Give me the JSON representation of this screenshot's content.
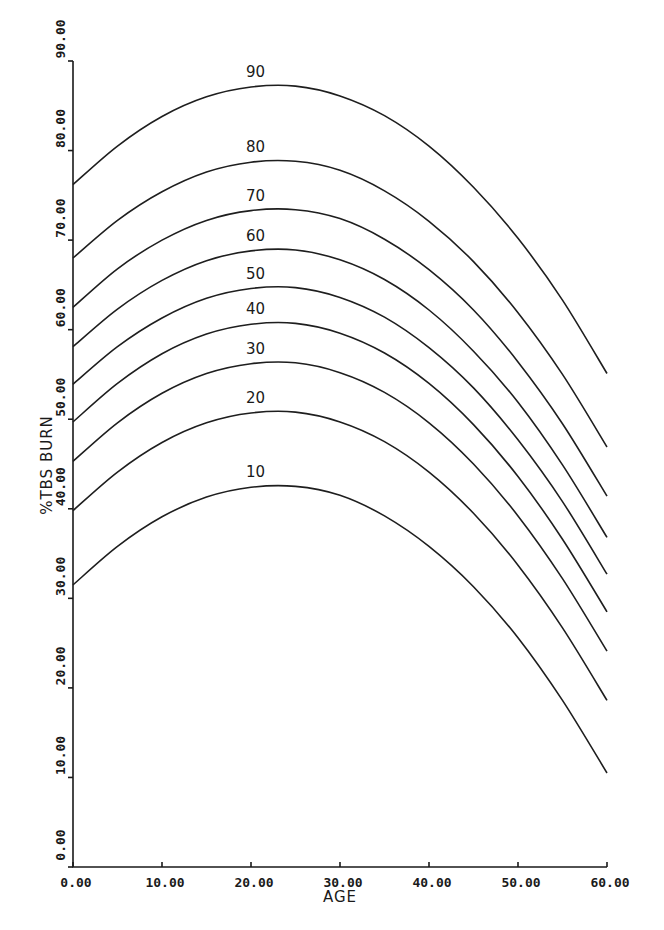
{
  "chart_data": {
    "type": "line",
    "title": "",
    "xlabel": "AGE",
    "ylabel": "%TBS BURN",
    "xlim": [
      0,
      60
    ],
    "ylim": [
      0,
      90
    ],
    "grid": false,
    "legend": "inline labels above each curve peak",
    "x_ticks": [
      "0.00",
      "10.00",
      "20.00",
      "30.00",
      "40.00",
      "50.00",
      "60.00"
    ],
    "y_ticks": [
      "0.00",
      "10.00",
      "20.00",
      "30.00",
      "40.00",
      "50.00",
      "60.00",
      "70.00",
      "80.00",
      "90.00"
    ],
    "x": [
      0,
      5,
      10,
      15,
      20,
      25,
      30,
      35,
      40,
      45,
      50,
      55,
      60
    ],
    "series": [
      {
        "name": "90",
        "values": [
          76.2,
          80.5,
          83.8,
          86.0,
          87.1,
          87.2,
          86.1,
          83.9,
          80.5,
          75.9,
          70.2,
          63.3,
          55.1
        ]
      },
      {
        "name": "80",
        "values": [
          68.0,
          72.2,
          75.4,
          77.6,
          78.7,
          78.8,
          77.8,
          75.5,
          72.1,
          67.6,
          61.9,
          55.0,
          46.9
        ]
      },
      {
        "name": "70",
        "values": [
          62.5,
          66.8,
          70.0,
          72.2,
          73.3,
          73.4,
          72.4,
          70.1,
          66.7,
          62.2,
          56.4,
          49.5,
          41.4
        ]
      },
      {
        "name": "60",
        "values": [
          58.1,
          62.3,
          65.5,
          67.7,
          68.8,
          68.9,
          67.8,
          65.6,
          62.2,
          57.6,
          51.9,
          44.9,
          36.8
        ]
      },
      {
        "name": "50",
        "values": [
          53.9,
          58.1,
          61.3,
          63.5,
          64.6,
          64.7,
          63.6,
          61.4,
          58.0,
          53.5,
          47.7,
          40.8,
          32.7
        ]
      },
      {
        "name": "40",
        "values": [
          49.7,
          54.0,
          57.3,
          59.5,
          60.6,
          60.7,
          59.6,
          57.4,
          54.0,
          49.4,
          43.6,
          36.6,
          28.5
        ]
      },
      {
        "name": "30",
        "values": [
          45.3,
          49.6,
          52.9,
          55.1,
          56.2,
          56.3,
          55.2,
          53.0,
          49.6,
          45.0,
          39.2,
          32.2,
          24.1
        ]
      },
      {
        "name": "20",
        "values": [
          39.8,
          44.1,
          47.4,
          49.6,
          50.7,
          50.8,
          49.7,
          47.5,
          44.1,
          39.5,
          33.7,
          26.7,
          18.6
        ]
      },
      {
        "name": "10",
        "values": [
          31.5,
          35.8,
          39.1,
          41.3,
          42.4,
          42.5,
          41.5,
          39.2,
          35.8,
          31.3,
          25.6,
          18.6,
          10.5
        ]
      }
    ],
    "curve_label_age": 20.5
  }
}
